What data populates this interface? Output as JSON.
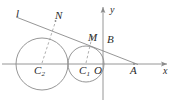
{
  "figure": {
    "type": "geometry-diagram",
    "stroke_color": "#8a8a8a",
    "label_color": "#2b2b2b",
    "background": "#ffffff"
  },
  "axes": {
    "x_label": "x",
    "y_label": "y",
    "origin_label": "O",
    "x_axis": {
      "y": 64,
      "x_start": 2,
      "x_end": 168
    },
    "y_axis": {
      "x": 103,
      "y_start": 6,
      "y_end": 100
    }
  },
  "circles": [
    {
      "name": "circle-c2",
      "center_label": "C",
      "center_subscript": "2",
      "cx": 42,
      "cy": 64,
      "r": 26
    },
    {
      "name": "circle-c1",
      "center_label": "C",
      "center_subscript": "1",
      "cx": 86,
      "cy": 64,
      "r": 18
    }
  ],
  "points": [
    {
      "name": "point-n",
      "label": "N",
      "x": 57,
      "y": 23
    },
    {
      "name": "point-m",
      "label": "M",
      "x": 92,
      "y": 39
    },
    {
      "name": "point-b",
      "label": "B",
      "x": 110,
      "y": 41
    },
    {
      "name": "point-o",
      "label": "O",
      "x": 106,
      "y": 64
    },
    {
      "name": "point-a",
      "label": "A",
      "x": 134,
      "y": 64
    }
  ],
  "tangent_line": {
    "name": "line-l",
    "label": "l",
    "x_start": 16,
    "y_start": 17,
    "x_end": 138,
    "y_end": 64
  },
  "dashed_radii": [
    {
      "name": "radius-c2-n",
      "x1": 42,
      "y1": 64,
      "x2": 55,
      "y2": 21
    },
    {
      "name": "radius-c1-m",
      "x1": 86,
      "y1": 64,
      "x2": 92,
      "y2": 37
    }
  ],
  "labels": {
    "l": "l",
    "N": "N",
    "M": "M",
    "B": "B",
    "O": "O",
    "A": "A",
    "x": "x",
    "y": "y",
    "C": "C",
    "sub1": "1",
    "sub2": "2"
  }
}
